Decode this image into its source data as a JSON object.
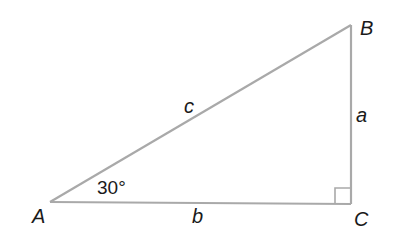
{
  "diagram": {
    "vertices": {
      "A": {
        "label": "A",
        "x": 50,
        "y": 202
      },
      "B": {
        "label": "B",
        "x": 351,
        "y": 25
      },
      "C": {
        "label": "C",
        "x": 351,
        "y": 204
      }
    },
    "sides": {
      "a": {
        "label": "a"
      },
      "b": {
        "label": "b"
      },
      "c": {
        "label": "c"
      }
    },
    "angle_A": {
      "label": "30°"
    },
    "right_angle_at": "C",
    "colors": {
      "line": "#a9a9a9",
      "text": "#1a1a1a"
    }
  }
}
